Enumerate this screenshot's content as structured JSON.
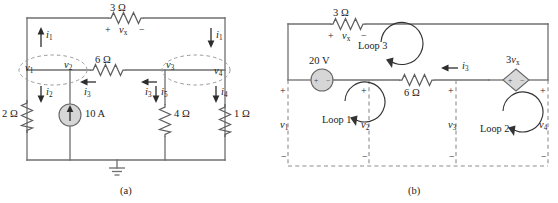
{
  "figure": {
    "panels": [
      {
        "id": "a",
        "caption": "(a)"
      },
      {
        "id": "b",
        "caption": "(b)"
      }
    ]
  },
  "panel_a": {
    "caption": "(a)",
    "components": {
      "r_top": "3 Ω",
      "r_mid": "6 Ω",
      "r_left": "2 Ω",
      "r_right_inner": "4 Ω",
      "r_right_outer": "1 Ω",
      "current_source": "10 A"
    },
    "voltage_label": {
      "name": "v",
      "sub": "x",
      "plus": "+",
      "minus": "−"
    },
    "node_labels": [
      {
        "name": "v",
        "sub": "1"
      },
      {
        "name": "v",
        "sub": "2"
      },
      {
        "name": "v",
        "sub": "3"
      },
      {
        "name": "v",
        "sub": "4"
      }
    ],
    "currents": [
      {
        "name": "i",
        "sub": "1",
        "dir": "up"
      },
      {
        "name": "i",
        "sub": "1",
        "dir": "down"
      },
      {
        "name": "i",
        "sub": "2",
        "dir": "down"
      },
      {
        "name": "i",
        "sub": "3",
        "dir": "left"
      },
      {
        "name": "i",
        "sub": "3",
        "dir": "left"
      },
      {
        "name": "i",
        "sub": "5",
        "dir": "down"
      },
      {
        "name": "i",
        "sub": "4",
        "dir": "down"
      }
    ],
    "supernodes": 2,
    "ground": true
  },
  "panel_b": {
    "caption": "(b)",
    "components": {
      "r_top": "3 Ω",
      "r_mid": "6 Ω",
      "voltage_source": "20 V",
      "dependent_source": {
        "gain": "3",
        "name": "v",
        "sub": "x"
      }
    },
    "voltage_label": {
      "name": "v",
      "sub": "x",
      "plus": "+",
      "minus": "−"
    },
    "loops": [
      {
        "label": "Loop 1"
      },
      {
        "label": "Loop 2"
      },
      {
        "label": "Loop 3"
      }
    ],
    "mesh_voltages": [
      {
        "name": "v",
        "sub": "1",
        "plus": "+",
        "minus": "−"
      },
      {
        "name": "v",
        "sub": "2",
        "plus": "+",
        "minus": "−"
      },
      {
        "name": "v",
        "sub": "3",
        "plus": "+",
        "minus": "−"
      },
      {
        "name": "v",
        "sub": "4",
        "plus": "+",
        "minus": "−"
      }
    ],
    "currents": [
      {
        "name": "i",
        "sub": "3",
        "dir": "left"
      }
    ],
    "source_signs": {
      "plus": "+",
      "minus": "−"
    }
  },
  "colors": {
    "wire": "#6f6f6f",
    "source_fill": "#d6d6d6",
    "dashed": "#9a9a9a",
    "text": "#1c1c1c",
    "background": "#ffffff"
  }
}
